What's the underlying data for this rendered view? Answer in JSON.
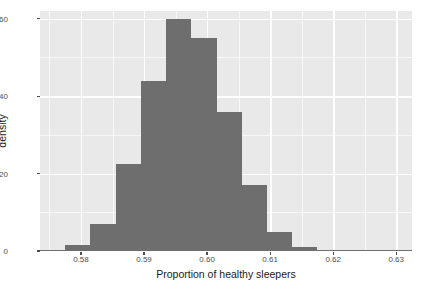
{
  "chart_data": {
    "type": "bar",
    "title": "",
    "subtitle": "",
    "xlabel": "Proportion of healthy sleepers",
    "ylabel": "density",
    "xlim": [
      0.5735,
      0.6325
    ],
    "ylim": [
      0,
      62
    ],
    "grid": true,
    "legend": null,
    "bin_width": 0.004,
    "bar_color": "#6e6e6e",
    "panel_color": "#e9e9e9",
    "grid_color": "#ffffff",
    "x_ticks": [
      0.58,
      0.59,
      0.6,
      0.61,
      0.62,
      0.63
    ],
    "x_tick_labels": [
      "0.58",
      "0.59",
      "0.60",
      "0.61",
      "0.62",
      "0.63"
    ],
    "y_ticks": [
      0,
      20,
      40,
      60
    ],
    "y_tick_labels": [
      "0",
      "20",
      "40",
      "60"
    ],
    "x_minor_ticks": [
      0.575,
      0.585,
      0.595,
      0.605,
      0.615,
      0.625
    ],
    "y_minor_ticks": [
      10,
      30,
      50
    ],
    "bins": [
      {
        "left": 0.5735,
        "right": 0.5775,
        "center": 0.5755,
        "value": 0.3
      },
      {
        "left": 0.5775,
        "right": 0.5815,
        "center": 0.5795,
        "value": 1.5
      },
      {
        "left": 0.5815,
        "right": 0.5855,
        "center": 0.5835,
        "value": 7.0
      },
      {
        "left": 0.5855,
        "right": 0.5895,
        "center": 0.5875,
        "value": 22.5
      },
      {
        "left": 0.5895,
        "right": 0.5935,
        "center": 0.5915,
        "value": 44.0
      },
      {
        "left": 0.5935,
        "right": 0.5975,
        "center": 0.5955,
        "value": 60.0
      },
      {
        "left": 0.5975,
        "right": 0.6015,
        "center": 0.5995,
        "value": 55.0
      },
      {
        "left": 0.6015,
        "right": 0.6055,
        "center": 0.6035,
        "value": 36.0
      },
      {
        "left": 0.6055,
        "right": 0.6095,
        "center": 0.6075,
        "value": 17.0
      },
      {
        "left": 0.6095,
        "right": 0.6135,
        "center": 0.6115,
        "value": 5.0
      },
      {
        "left": 0.6135,
        "right": 0.6175,
        "center": 0.6155,
        "value": 1.0
      },
      {
        "left": 0.6175,
        "right": 0.6215,
        "center": 0.6195,
        "value": 0.2
      },
      {
        "left": 0.6215,
        "right": 0.6325,
        "center": 0.627,
        "value": 0.15
      }
    ],
    "categories": [
      "0.5755",
      "0.5795",
      "0.5835",
      "0.5875",
      "0.5915",
      "0.5955",
      "0.5995",
      "0.6035",
      "0.6075",
      "0.6115",
      "0.6155",
      "0.6195",
      "0.6270"
    ],
    "values": [
      0.3,
      1.5,
      7.0,
      22.5,
      44.0,
      60.0,
      55.0,
      36.0,
      17.0,
      5.0,
      1.0,
      0.2,
      0.15
    ]
  }
}
